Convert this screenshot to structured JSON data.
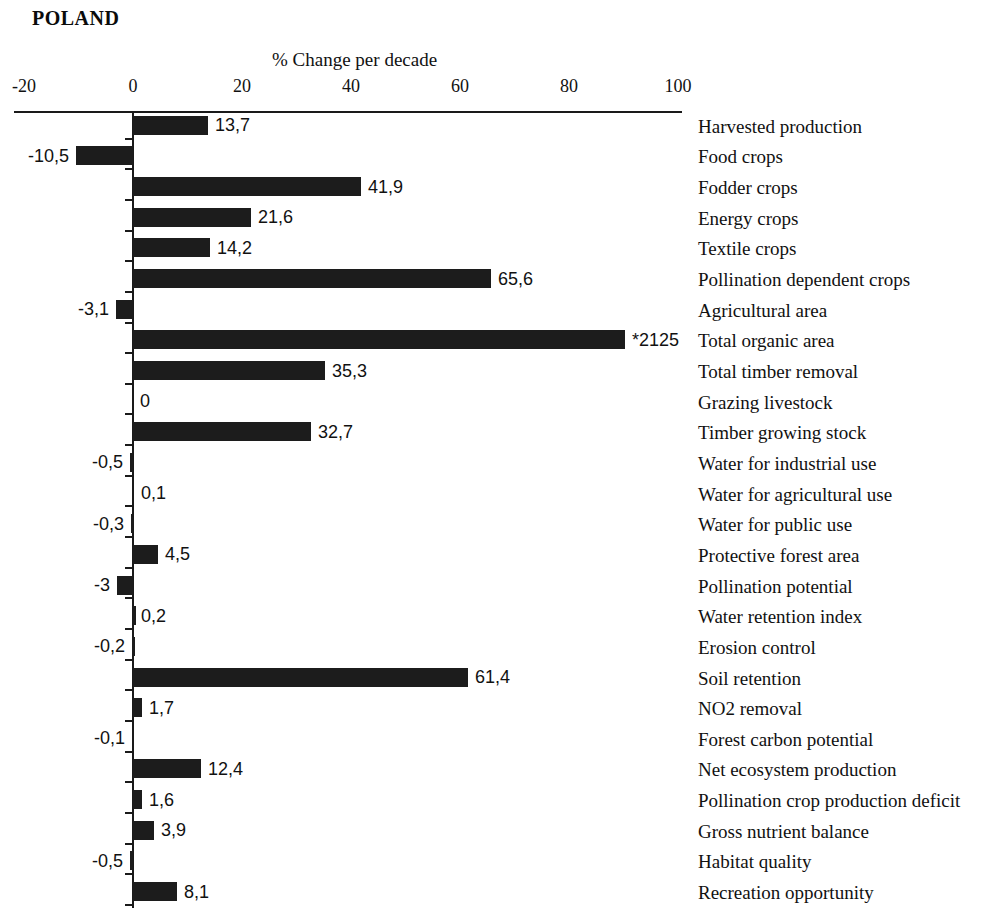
{
  "title": "POLAND",
  "axis_title": "% Change per decade",
  "chart_data": {
    "type": "bar",
    "orientation": "horizontal",
    "title": "POLAND",
    "xlabel": "% Change per decade",
    "ylabel": "",
    "xlim": [
      -20,
      100
    ],
    "xticks": [
      -20,
      0,
      20,
      40,
      60,
      80,
      100
    ],
    "xtick_labels": [
      "-20",
      "0",
      "20",
      "40",
      "60",
      "80",
      "100"
    ],
    "grid": false,
    "legend": null,
    "bar_color": "#1c1c1c",
    "note": "Bar for Total organic area is truncated at the plot edge; its data label reads *2125",
    "categories": [
      "Harvested production",
      "Food crops",
      "Fodder crops",
      "Energy crops",
      "Textile crops",
      "Pollination dependent crops",
      "Agricultural area",
      "Total organic area",
      "Total timber removal",
      "Grazing livestock",
      "Timber growing stock",
      "Water for industrial use",
      "Water for agricultural use",
      "Water for public use",
      "Protective forest area",
      "Pollination potential",
      "Water retention index",
      "Erosion control",
      "Soil retention",
      "NO2 removal",
      "Forest carbon potential",
      "Net ecosystem production",
      "Pollination crop production deficit",
      "Gross nutrient balance",
      "Habitat quality",
      "Recreation opportunity"
    ],
    "values": [
      13.7,
      -10.5,
      41.9,
      21.6,
      14.2,
      65.6,
      -3.1,
      2125,
      35.3,
      0,
      32.7,
      -0.5,
      0.1,
      -0.3,
      4.5,
      -3,
      0.2,
      -0.2,
      61.4,
      1.7,
      -0.1,
      12.4,
      1.6,
      3.9,
      -0.5,
      8.1
    ],
    "value_labels": [
      "13,7",
      "-10,5",
      "41,9",
      "21,6",
      "14,2",
      "65,6",
      "-3,1",
      "*2125",
      "35,3",
      "0",
      "32,7",
      "-0,5",
      "0,1",
      "-0,3",
      "4,5",
      "-3",
      "0,2",
      "-0,2",
      "61,4",
      "1,7",
      "-0,1",
      "12,4",
      "1,6",
      "3,9",
      "-0,5",
      "8,1"
    ]
  }
}
